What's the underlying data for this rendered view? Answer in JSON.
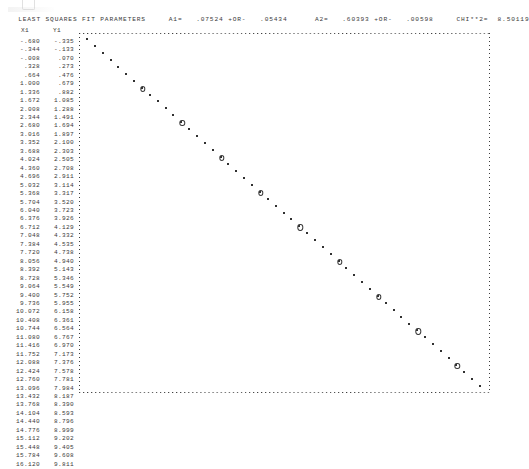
{
  "header": {
    "title": "LEAST SQUARES FIT PARAMETERS",
    "a1_label": "A1=",
    "a1_value": ".07524",
    "a1_pm": "+OR-",
    "a1_error": ".05434",
    "a2_label": "A2=",
    "a2_value": ".60393",
    "a2_pm": "+OR-",
    "a2_error": ".00598",
    "chi_label": "CHI**2=",
    "chi_value": "8.50119",
    "full_line": "LEAST SQUARES FIT PARAMETERS     A1=   .07524 +OR-   .05434      A2=   .60393 +OR-   .00598     CHI**2=  8.50119"
  },
  "table": {
    "columns": [
      "X1",
      "Y1"
    ],
    "rows": [
      [
        "-.680",
        "-.335"
      ],
      [
        "-.344",
        "-.133"
      ],
      [
        "-.008",
        ".070"
      ],
      [
        ".328",
        ".273"
      ],
      [
        ".664",
        ".476"
      ],
      [
        "1.000",
        ".679"
      ],
      [
        "1.336",
        ".882"
      ],
      [
        "1.672",
        "1.085"
      ],
      [
        "2.008",
        "1.288"
      ],
      [
        "2.344",
        "1.491"
      ],
      [
        "2.680",
        "1.694"
      ],
      [
        "3.016",
        "1.897"
      ],
      [
        "3.352",
        "2.100"
      ],
      [
        "3.688",
        "2.303"
      ],
      [
        "4.024",
        "2.505"
      ],
      [
        "4.360",
        "2.708"
      ],
      [
        "4.696",
        "2.911"
      ],
      [
        "5.032",
        "3.114"
      ],
      [
        "5.368",
        "3.317"
      ],
      [
        "5.704",
        "3.520"
      ],
      [
        "6.040",
        "3.723"
      ],
      [
        "6.376",
        "3.926"
      ],
      [
        "6.712",
        "4.129"
      ],
      [
        "7.048",
        "4.332"
      ],
      [
        "7.384",
        "4.535"
      ],
      [
        "7.720",
        "4.738"
      ],
      [
        "8.056",
        "4.940"
      ],
      [
        "8.392",
        "5.143"
      ],
      [
        "8.728",
        "5.346"
      ],
      [
        "9.064",
        "5.549"
      ],
      [
        "9.400",
        "5.752"
      ],
      [
        "9.736",
        "5.955"
      ],
      [
        "10.072",
        "6.158"
      ],
      [
        "10.408",
        "6.361"
      ],
      [
        "10.744",
        "6.564"
      ],
      [
        "11.080",
        "6.767"
      ],
      [
        "11.416",
        "6.970"
      ],
      [
        "11.752",
        "7.173"
      ],
      [
        "12.088",
        "7.376"
      ],
      [
        "12.424",
        "7.578"
      ],
      [
        "12.760",
        "7.781"
      ],
      [
        "13.096",
        "7.984"
      ],
      [
        "13.432",
        "8.187"
      ],
      [
        "13.768",
        "8.390"
      ],
      [
        "14.104",
        "8.593"
      ],
      [
        "14.440",
        "8.796"
      ],
      [
        "14.776",
        "8.999"
      ],
      [
        "15.112",
        "9.202"
      ],
      [
        "15.448",
        "9.405"
      ],
      [
        "15.784",
        "9.608"
      ],
      [
        "16.120",
        "9.811"
      ]
    ]
  },
  "chart_data": {
    "type": "scatter",
    "title": "",
    "xlabel": "",
    "ylabel": "",
    "grid": false,
    "legend": null,
    "note": "Line-printer character plot. Y axis is inverted on the page: small Y values print near the top, large Y values near the bottom. '*' marks measured data, '0' marks the least-squares fit overlay.",
    "xlim": [
      -0.68,
      16.12
    ],
    "ylim": [
      -0.335,
      9.811
    ],
    "series": [
      {
        "name": "data",
        "marker": "*",
        "x": [
          -0.68,
          -0.344,
          -0.008,
          0.328,
          0.664,
          1.0,
          1.336,
          1.672,
          2.008,
          2.344,
          2.68,
          3.016,
          3.352,
          3.688,
          4.024,
          4.36,
          4.696,
          5.032,
          5.368,
          5.704,
          6.04,
          6.376,
          6.712,
          7.048,
          7.384,
          7.72,
          8.056,
          8.392,
          8.728,
          9.064,
          9.4,
          9.736,
          10.072,
          10.408,
          10.744,
          11.08,
          11.416,
          11.752,
          12.088,
          12.424,
          12.76,
          13.096,
          13.432,
          13.768,
          14.104,
          14.44,
          14.776,
          15.112,
          15.448,
          15.784,
          16.12
        ],
        "y": [
          -0.335,
          -0.133,
          0.07,
          0.273,
          0.476,
          0.679,
          0.882,
          1.085,
          1.288,
          1.491,
          1.694,
          1.897,
          2.1,
          2.303,
          2.505,
          2.708,
          2.911,
          3.114,
          3.317,
          3.52,
          3.723,
          3.926,
          4.129,
          4.332,
          4.535,
          4.738,
          4.94,
          5.143,
          5.346,
          5.549,
          5.752,
          5.955,
          6.158,
          6.361,
          6.564,
          6.767,
          6.97,
          7.173,
          7.376,
          7.578,
          7.781,
          7.984,
          8.187,
          8.39,
          8.593,
          8.796,
          8.999,
          9.202,
          9.405,
          9.608,
          9.811
        ]
      },
      {
        "name": "fit",
        "marker": "0",
        "x": [
          1.672,
          3.352,
          5.032,
          6.712,
          8.392,
          10.072,
          11.752,
          13.432,
          15.112
        ],
        "y": [
          1.085,
          2.1,
          3.114,
          4.129,
          5.143,
          6.158,
          7.173,
          8.187,
          9.202
        ]
      }
    ]
  }
}
